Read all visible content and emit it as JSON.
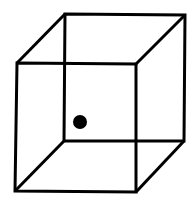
{
  "diagram": {
    "type": "necker-cube",
    "stroke_color": "#000000",
    "background": "#ffffff",
    "back_face": [
      [
        65,
        14
      ],
      [
        185,
        15
      ],
      [
        184,
        141
      ],
      [
        64,
        141
      ]
    ],
    "front_face": [
      [
        17,
        63
      ],
      [
        136,
        64
      ],
      [
        136,
        192
      ],
      [
        15,
        191
      ]
    ],
    "dot": {
      "cx": 80,
      "cy": 122,
      "r": 7
    }
  }
}
